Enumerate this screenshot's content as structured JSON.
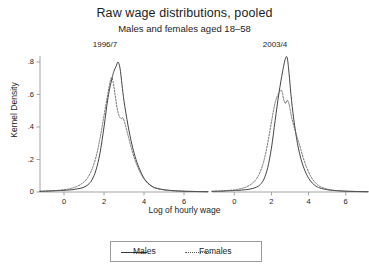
{
  "chart_data": {
    "type": "line",
    "title": "Raw wage distributions, pooled",
    "subtitle": "Males and females aged 18–58",
    "xlabel": "Log of hourly wage",
    "ylabel": "Kernel Density",
    "grid": false,
    "legend_position": "bottom-center",
    "xlim": [
      -1.2,
      7.2
    ],
    "ylim": [
      0,
      0.88
    ],
    "xticks": [
      0,
      2,
      4,
      6
    ],
    "xtick_labels": [
      "0",
      "2",
      "4",
      "6"
    ],
    "yticks": [
      0,
      0.2,
      0.4,
      0.6,
      0.8
    ],
    "ytick_labels": [
      "0",
      ".2",
      ".4",
      ".6",
      ".8"
    ],
    "legend": [
      "Males",
      "Females"
    ],
    "panels": [
      {
        "label": "1996/7",
        "series": [
          {
            "name": "Males",
            "style": "solid",
            "color": "#3a3a3a",
            "x": [
              -1.2,
              -0.8,
              -0.4,
              0.0,
              0.2,
              0.4,
              0.6,
              0.8,
              1.0,
              1.2,
              1.4,
              1.6,
              1.8,
              2.0,
              2.2,
              2.4,
              2.5,
              2.6,
              2.7,
              2.8,
              2.9,
              3.0,
              3.2,
              3.4,
              3.6,
              3.8,
              4.0,
              4.2,
              4.4,
              4.6,
              5.0,
              5.4,
              6.0,
              6.6,
              7.2
            ],
            "y": [
              0.004,
              0.006,
              0.008,
              0.01,
              0.012,
              0.014,
              0.018,
              0.022,
              0.03,
              0.045,
              0.075,
              0.135,
              0.24,
              0.4,
              0.58,
              0.7,
              0.745,
              0.772,
              0.8,
              0.762,
              0.66,
              0.56,
              0.41,
              0.29,
              0.2,
              0.135,
              0.085,
              0.055,
              0.035,
              0.024,
              0.014,
              0.009,
              0.005,
              0.003,
              0.002
            ]
          },
          {
            "name": "Females",
            "style": "dotted",
            "color": "#5a5a5a",
            "x": [
              -1.2,
              -0.8,
              -0.4,
              0.0,
              0.2,
              0.4,
              0.6,
              0.8,
              1.0,
              1.2,
              1.4,
              1.6,
              1.8,
              2.0,
              2.2,
              2.35,
              2.45,
              2.55,
              2.65,
              2.75,
              2.85,
              2.95,
              3.05,
              3.2,
              3.4,
              3.6,
              3.8,
              4.0,
              4.2,
              4.4,
              4.6,
              5.0,
              5.4,
              6.0,
              6.6,
              7.2
            ],
            "y": [
              0.004,
              0.006,
              0.009,
              0.014,
              0.018,
              0.024,
              0.032,
              0.044,
              0.062,
              0.092,
              0.14,
              0.215,
              0.33,
              0.47,
              0.61,
              0.7,
              0.68,
              0.6,
              0.52,
              0.47,
              0.452,
              0.455,
              0.42,
              0.35,
              0.255,
              0.18,
              0.122,
              0.08,
              0.052,
              0.034,
              0.023,
              0.013,
              0.008,
              0.004,
              0.003,
              0.002
            ]
          }
        ]
      },
      {
        "label": "2003/4",
        "series": [
          {
            "name": "Males",
            "style": "solid",
            "color": "#3a3a3a",
            "x": [
              -1.2,
              -0.8,
              -0.4,
              0.0,
              0.2,
              0.4,
              0.6,
              0.8,
              1.0,
              1.2,
              1.4,
              1.6,
              1.8,
              2.0,
              2.2,
              2.4,
              2.6,
              2.75,
              2.85,
              2.95,
              3.05,
              3.2,
              3.4,
              3.6,
              3.8,
              4.0,
              4.2,
              4.4,
              4.6,
              5.0,
              5.4,
              6.0,
              6.6,
              7.2
            ],
            "y": [
              0.004,
              0.005,
              0.007,
              0.009,
              0.01,
              0.012,
              0.014,
              0.017,
              0.022,
              0.03,
              0.046,
              0.08,
              0.15,
              0.27,
              0.44,
              0.605,
              0.74,
              0.82,
              0.825,
              0.73,
              0.6,
              0.45,
              0.3,
              0.2,
              0.132,
              0.085,
              0.055,
              0.036,
              0.025,
              0.014,
              0.009,
              0.005,
              0.003,
              0.002
            ]
          },
          {
            "name": "Females",
            "style": "dotted",
            "color": "#5a5a5a",
            "x": [
              -1.2,
              -0.8,
              -0.4,
              0.0,
              0.2,
              0.4,
              0.6,
              0.8,
              1.0,
              1.2,
              1.4,
              1.6,
              1.8,
              2.0,
              2.2,
              2.4,
              2.55,
              2.65,
              2.75,
              2.85,
              2.95,
              3.05,
              3.15,
              3.3,
              3.5,
              3.7,
              3.9,
              4.1,
              4.3,
              4.6,
              5.0,
              5.4,
              6.0,
              6.6,
              7.2
            ],
            "y": [
              0.004,
              0.006,
              0.009,
              0.013,
              0.017,
              0.022,
              0.029,
              0.04,
              0.056,
              0.082,
              0.125,
              0.195,
              0.3,
              0.43,
              0.55,
              0.61,
              0.625,
              0.575,
              0.545,
              0.565,
              0.54,
              0.48,
              0.43,
              0.37,
              0.295,
              0.215,
              0.15,
              0.1,
              0.065,
              0.035,
              0.018,
              0.01,
              0.005,
              0.003,
              0.002
            ]
          }
        ]
      }
    ]
  }
}
